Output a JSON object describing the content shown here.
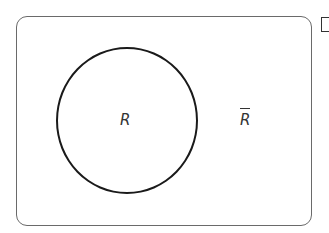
{
  "diagram": {
    "type": "venn",
    "universe": {
      "shape": "rounded-rectangle"
    },
    "sets": [
      {
        "label": "R",
        "shape": "circle"
      }
    ],
    "complement_label": "R",
    "complement_notation": "overline"
  },
  "edge_glyph": "partial-bracket"
}
